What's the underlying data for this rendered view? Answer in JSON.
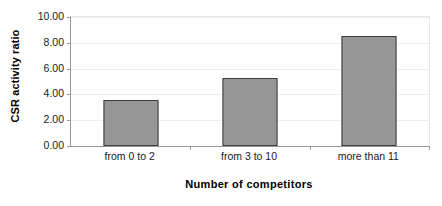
{
  "chart_data": {
    "type": "bar",
    "title": "",
    "categories": [
      "from 0 to 2",
      "from 3 to 10",
      "more than 11"
    ],
    "values": [
      3.6,
      5.3,
      8.5
    ],
    "xlabel": "Number of competitors",
    "ylabel": "CSR activity ratio",
    "ylim": [
      0,
      10
    ],
    "ytick_values": [
      0,
      2,
      4,
      6,
      8,
      10
    ],
    "ytick_labels": [
      "0.00",
      "2.00",
      "4.00",
      "6.00",
      "8.00",
      "10.00"
    ],
    "grid": true,
    "legend": "none",
    "series": [
      {
        "name": "CSR activity ratio",
        "values": [
          3.6,
          5.3,
          8.5
        ]
      }
    ],
    "colors": {
      "bar_fill": "#969696",
      "bar_border": "#3d3d3d",
      "axis_line": "#9a9a9a",
      "gridline": "#ededed",
      "text": "#1a1a1a",
      "background": "#ffffff"
    }
  }
}
